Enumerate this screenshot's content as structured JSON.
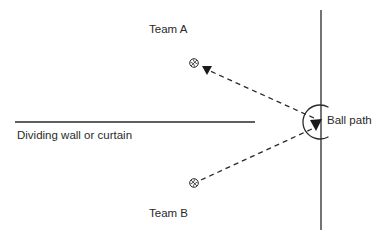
{
  "labels": {
    "team_a": "Team A",
    "team_b": "Team B",
    "wall": "Dividing wall or curtain",
    "ball_path": "Ball path"
  },
  "icons": {
    "ball": "basketball-icon",
    "arrow": "arrowhead-icon"
  },
  "colors": {
    "line": "#2a2a2a",
    "background": "#ffffff"
  }
}
